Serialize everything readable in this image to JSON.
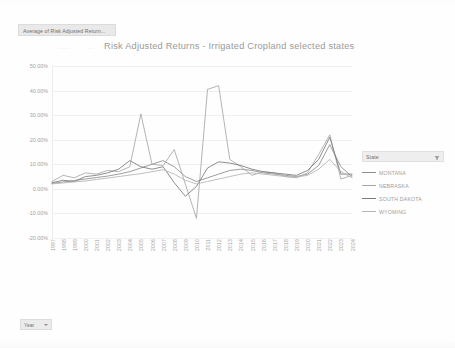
{
  "field_tab": {
    "label": "Average of Risk Adjusted Return..."
  },
  "ghost": {
    "mark1": "......",
    "mark2": "..."
  },
  "legend": {
    "header_label": "State",
    "filter_icon": "filter-funnel-icon",
    "items": [
      {
        "label": "MONTANA",
        "color": "#8d8d8d"
      },
      {
        "label": "NEBRASKA",
        "color": "#a6a6a6"
      },
      {
        "label": "SOUTH DAKOTA",
        "color": "#7a7a7a"
      },
      {
        "label": "WYOMING",
        "color": "#b4b4b4"
      }
    ]
  },
  "year_slicer": {
    "label": "Year",
    "caret_icon": "chevron-down-icon"
  },
  "chart_data": {
    "type": "line",
    "title": "Risk Adjusted Returns - Irrigated Cropland selected states",
    "xlabel": "",
    "ylabel": "",
    "ylim": [
      -20,
      50
    ],
    "yticks": [
      50,
      40,
      30,
      20,
      10,
      0,
      -10,
      -20
    ],
    "ytick_labels": [
      "50.00%",
      "40.00%",
      "30.00%",
      "20.00%",
      "10.00%",
      "0.00%",
      "-10.00%",
      "-20.00%"
    ],
    "grid": true,
    "legend_position": "right",
    "categories": [
      "1997",
      "1998",
      "1999",
      "2000",
      "2001",
      "2002",
      "2003",
      "2004",
      "2005",
      "2006",
      "2007",
      "2008",
      "2009",
      "2010",
      "2011",
      "2012",
      "2013",
      "2014",
      "2015",
      "2016",
      "2017",
      "2018",
      "2019",
      "2020",
      "2021",
      "2022",
      "2023",
      "2024"
    ],
    "series": [
      {
        "name": "MONTANA",
        "color": "#8d8d8d",
        "values": [
          2.2,
          2.8,
          3.4,
          4.0,
          4.6,
          5.2,
          6.0,
          7.0,
          8.5,
          10.0,
          11.5,
          9.0,
          5.0,
          3.0,
          4.5,
          6.0,
          7.5,
          8.0,
          7.5,
          6.5,
          6.0,
          5.5,
          5.0,
          6.0,
          9.5,
          18.0,
          9.0,
          5.0
        ]
      },
      {
        "name": "NEBRASKA",
        "color": "#a6a6a6",
        "values": [
          3.0,
          5.5,
          4.5,
          6.5,
          6.0,
          7.5,
          7.0,
          9.0,
          30.5,
          10.0,
          9.5,
          16.0,
          2.0,
          -12.0,
          40.5,
          42.0,
          12.0,
          9.0,
          5.5,
          7.0,
          6.5,
          5.0,
          4.5,
          6.5,
          14.0,
          22.0,
          4.0,
          5.5
        ]
      },
      {
        "name": "SOUTH DAKOTA",
        "color": "#7a7a7a",
        "values": [
          2.5,
          3.5,
          3.0,
          5.0,
          5.5,
          6.5,
          8.0,
          11.5,
          9.0,
          8.0,
          9.0,
          2.5,
          -3.0,
          1.0,
          8.5,
          11.0,
          10.5,
          9.5,
          8.0,
          7.0,
          6.5,
          6.0,
          5.5,
          7.5,
          12.0,
          21.0,
          6.0,
          6.0
        ]
      },
      {
        "name": "WYOMING",
        "color": "#b4b4b4",
        "values": [
          2.0,
          2.4,
          2.8,
          3.2,
          3.8,
          4.4,
          5.0,
          5.6,
          6.2,
          7.0,
          7.8,
          6.0,
          3.5,
          2.0,
          3.0,
          4.0,
          5.0,
          6.0,
          6.5,
          6.0,
          5.5,
          5.0,
          4.8,
          5.5,
          8.0,
          12.0,
          7.0,
          4.5
        ]
      }
    ]
  }
}
